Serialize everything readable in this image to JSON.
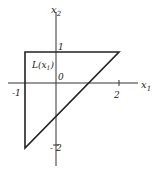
{
  "diagram": {
    "axes": {
      "x_label": "x",
      "x_sub": "1",
      "y_label": "x",
      "y_sub": "2",
      "origin_label": "0"
    },
    "ticks": {
      "x_neg1": "-1",
      "x_2": "2",
      "y_1": "1",
      "y_neg2": "- 2"
    },
    "region_label": "L(x",
    "region_label_sub": "1",
    "region_label_close": ")",
    "region": {
      "vertices": [
        [
          -1,
          1
        ],
        [
          2,
          1
        ],
        [
          -1,
          -2
        ]
      ],
      "description": "Triangle bounded by x1 = -1, x2 = 1, and x2 = x1 - 1"
    },
    "line_color": "#2a2a2a"
  }
}
